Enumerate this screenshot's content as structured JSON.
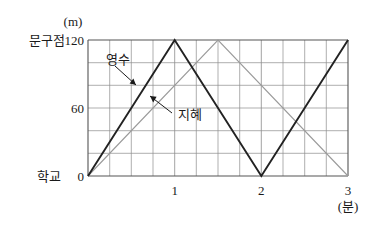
{
  "chart_data": {
    "type": "line",
    "title": "",
    "xlabel": "(분)",
    "ylabel": "(m)",
    "xlim": [
      0,
      3
    ],
    "ylim": [
      0,
      120
    ],
    "grid": true,
    "x_major_ticks": [
      0,
      1,
      2,
      3
    ],
    "x_major_tick_labels": [
      "",
      "1",
      "2",
      "3"
    ],
    "x_minor_step": 0.25,
    "y_major_ticks": [
      0,
      20,
      40,
      60,
      80,
      100,
      120
    ],
    "y_major_tick_labels": [
      "0",
      "",
      "",
      "60",
      "",
      "",
      "120"
    ],
    "y_axis_endpoint_labels": {
      "bottom": "학교",
      "top": "문구점"
    },
    "legend_position": "inline-annotation",
    "series": [
      {
        "name": "영수",
        "color": "#222222",
        "width": 1.9,
        "points": [
          {
            "x": 0,
            "y": 0
          },
          {
            "x": 1,
            "y": 120
          },
          {
            "x": 2,
            "y": 0
          },
          {
            "x": 3,
            "y": 120
          }
        ],
        "annotation": {
          "label": "영수",
          "label_x": 0.33,
          "label_y": 104,
          "arrow_to_x": 0.56,
          "arrow_to_y": 68
        }
      },
      {
        "name": "지혜",
        "color": "#9a9a9a",
        "width": 1.1,
        "points": [
          {
            "x": 0,
            "y": 0
          },
          {
            "x": 1.5,
            "y": 120
          },
          {
            "x": 3,
            "y": 0
          }
        ],
        "annotation": {
          "label": "지혜",
          "label_x": 1.04,
          "label_y": 55,
          "arrow_to_x": 0.83,
          "arrow_to_y": 68
        }
      }
    ]
  },
  "axis": {
    "y_unit": "(m)",
    "x_unit": "(분)",
    "y_top_value": "120",
    "y_mid_value": "60",
    "y_zero_value": "0",
    "y_top_place": "문구점",
    "y_zero_place": "학교",
    "x_tick_1": "1",
    "x_tick_2": "2",
    "x_tick_3": "3"
  },
  "series_labels": {
    "yeongsu": "영수",
    "jihye": "지혜"
  },
  "colors": {
    "yeongsu_line": "#222222",
    "jihye_line": "#9a9a9a",
    "grid": "#8c8c8c",
    "frame": "#555555",
    "text": "#1a1a1a",
    "background": "#ffffff"
  }
}
